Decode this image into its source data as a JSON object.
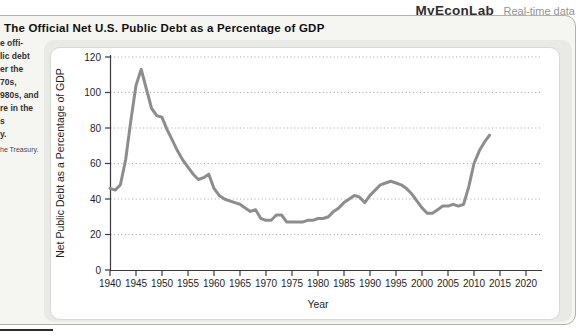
{
  "header": {
    "brand": "MyEconLab",
    "tagline": "Real-time data"
  },
  "figure": {
    "title": "The Official Net U.S. Public Debt as a Percentage of GDP",
    "caption_lines": [
      "e offi-",
      "lic debt",
      "er the",
      "70s,",
      "980s, and",
      "re in the",
      "s",
      "y."
    ],
    "source_line": "he Treasury."
  },
  "chart_data": {
    "type": "line",
    "title": "The Official Net U.S. Public Debt as a Percentage of GDP",
    "xlabel": "Year",
    "ylabel": "Net Public Debt as a Percentage of GDP",
    "xlim": [
      1940,
      2023
    ],
    "ylim": [
      0,
      120
    ],
    "x_ticks": [
      1940,
      1945,
      1950,
      1955,
      1960,
      1965,
      1970,
      1975,
      1980,
      1985,
      1990,
      1995,
      2000,
      2005,
      2010,
      2015,
      2020
    ],
    "y_ticks": [
      0,
      20,
      40,
      60,
      80,
      100,
      120
    ],
    "grid": "horizontal-dotted",
    "legend": "none",
    "series": [
      {
        "name": "Net public debt as a percentage of GDP",
        "x_start": 1940,
        "x_step": 1,
        "values": [
          46,
          45,
          48,
          62,
          84,
          104,
          113,
          102,
          91,
          87,
          86,
          79,
          73,
          67,
          62,
          58,
          54,
          51,
          52,
          54,
          46,
          42,
          40,
          39,
          38,
          37,
          35,
          33,
          34,
          29,
          28,
          28,
          31,
          31,
          27,
          27,
          27,
          27,
          28,
          28,
          29,
          29,
          30,
          33,
          35,
          38,
          40,
          42,
          41,
          38,
          42,
          45,
          48,
          49,
          50,
          49,
          48,
          46,
          43,
          39,
          35,
          32,
          32,
          34,
          36,
          36,
          37,
          36,
          37,
          47,
          60,
          67,
          72,
          76
        ]
      }
    ],
    "colors": {
      "line": "#8d8d8d",
      "grid": "#a3a3a3",
      "axis": "#3a3a3a",
      "text": "#1f1f1f"
    }
  }
}
